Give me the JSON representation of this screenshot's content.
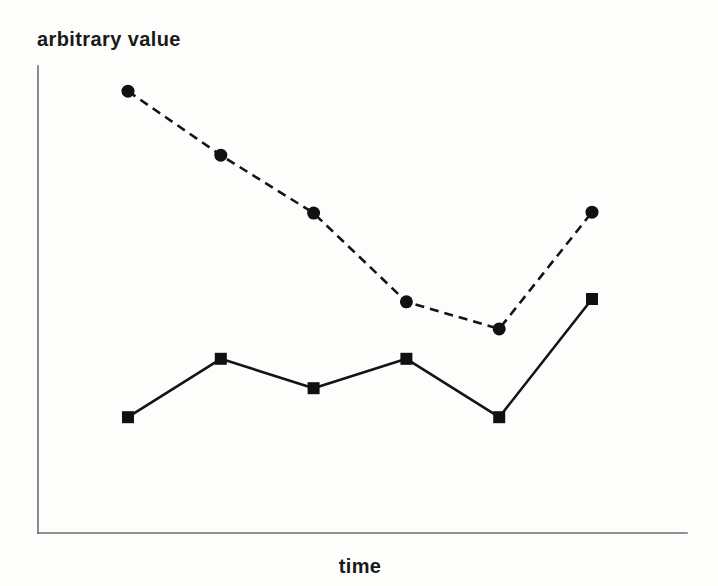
{
  "figure": {
    "ylabel": "arbitrary value",
    "xlabel": "time"
  },
  "chart_data": {
    "type": "line",
    "title": "",
    "xlabel": "time",
    "ylabel": "arbitrary value",
    "x": [
      1,
      2,
      3,
      4,
      5,
      6
    ],
    "series": [
      {
        "name": "dashed-circle-series",
        "style": "dashed",
        "marker": "circle",
        "values": [
          94.6,
          80.9,
          68.5,
          49.5,
          43.7,
          68.7
        ]
      },
      {
        "name": "solid-square-series",
        "style": "solid",
        "marker": "square",
        "values": [
          24.8,
          37.3,
          31.0,
          37.3,
          24.8,
          50.1
        ]
      }
    ],
    "ylim": [
      0,
      100
    ],
    "xlim": [
      0,
      7
    ],
    "grid": false,
    "legend": false,
    "tick_labels": "none",
    "colors": {
      "line": "#141414",
      "marker": "#111111",
      "axis": "#6e6e6e",
      "background": "#fdfdfc"
    }
  }
}
